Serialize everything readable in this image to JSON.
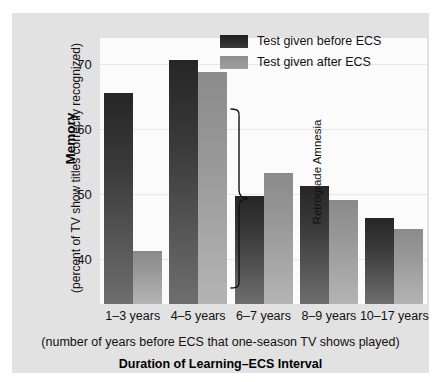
{
  "chart_data": {
    "type": "bar",
    "title": "",
    "categories": [
      "1–3 years",
      "4–5 years",
      "6–7 years",
      "8–9 years",
      "10–17 years"
    ],
    "series": [
      {
        "name": "Test given before ECS",
        "color": "#2c2c2c",
        "values": [
          65.5,
          70.6,
          49.6,
          51.2,
          46.3
        ]
      },
      {
        "name": "Test given after ECS",
        "color": "#949494",
        "values": [
          41.2,
          68.8,
          53.2,
          49.0,
          44.5
        ]
      }
    ],
    "ylabel": "Memory",
    "ylabel_sub": "(percent of TV show titles correctly recognized)",
    "xlabel": "Duration of Learning–ECS Interval",
    "xlabel_sub": "(number of years before ECS that one-season TV shows played)",
    "yticks": [
      40,
      50,
      60,
      70
    ],
    "ytick_labels": [
      "40",
      "50",
      "60",
      "70"
    ],
    "ylim": [
      33.0,
      74.0
    ],
    "grid": true,
    "legend_position": "top-right",
    "annotations": [
      {
        "text": "Retrograde Amnesia",
        "type": "brace",
        "target": "1–3 years"
      }
    ]
  },
  "legend": {
    "items": [
      {
        "label": "Test given before ECS",
        "color": "#2c2c2c"
      },
      {
        "label": "Test given after ECS",
        "color": "#949494"
      }
    ]
  },
  "axes": {
    "y_title": "Memory",
    "y_subtitle": "(percent of TV show titles correctly recognized)",
    "x_subtitle": "(number of years before ECS that one-season TV shows played)",
    "x_title": "Duration of Learning–ECS Interval",
    "y_tick_labels": [
      "70",
      "60",
      "50",
      "40"
    ],
    "x_tick_labels": [
      "1–3 years",
      "4–5 years",
      "6–7 years",
      "8–9 years",
      "10–17 years"
    ]
  },
  "annotation": {
    "label": "Retrograde Amnesia"
  },
  "colors": {
    "before_ecs": "#2c2c2c",
    "after_ecs": "#949494",
    "panel": "#e2e2e2",
    "plot": "#fbfbfb",
    "grid": "#e7e7e7"
  }
}
